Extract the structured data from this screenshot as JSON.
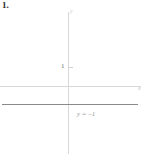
{
  "figure": {
    "problem_number": "1.",
    "background_color": "#ffffff"
  },
  "axes": {
    "x_label": "x",
    "y_label": "y",
    "axis_color": "#d8d8d8",
    "y_tick_label": "1"
  },
  "plot": {
    "equation_label": "y = –1",
    "line_color": "#8a8a8a"
  },
  "chart_data": {
    "type": "line",
    "title": "",
    "xlabel": "x",
    "ylabel": "y",
    "xlim": [
      -6.8,
      7.3
    ],
    "ylim": [
      -3.9,
      3.8
    ],
    "grid": false,
    "legend": "none",
    "series": [
      {
        "name": "y = -1",
        "equation": "y = -1",
        "x": [
          -6.6,
          7.0
        ],
        "values": [
          -1,
          -1
        ],
        "annotation": "y = –1"
      }
    ],
    "y_ticks": [
      1
    ],
    "y_tick_labels": [
      "1"
    ],
    "x_ticks": [],
    "x_tick_labels": []
  }
}
